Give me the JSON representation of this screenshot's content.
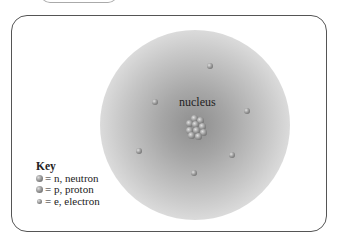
{
  "diagram": {
    "type": "atom-model",
    "nucleus_label": "nucleus",
    "electron_count": 6,
    "key": {
      "title": "Key",
      "items": [
        {
          "icon": "neutron-sphere-icon",
          "text": "= n, neutron"
        },
        {
          "icon": "proton-sphere-icon",
          "text": "= p, proton"
        },
        {
          "icon": "electron-sphere-icon",
          "text": "= e, electron"
        }
      ]
    },
    "colors": {
      "cloud": "#9a9a9a",
      "frame": "#555555",
      "particle": "#8a8a8a"
    }
  }
}
